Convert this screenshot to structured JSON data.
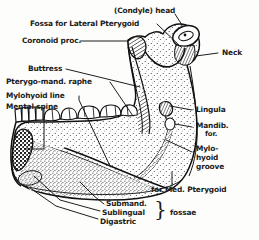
{
  "figure": {
    "background_color": "#fdfdfb",
    "ink_color": "#1a1a1a"
  },
  "labels": {
    "condyle_head": "(Condyle) head",
    "fossa_lateral_pterygoid": "Fossa for Lateral Pterygoid",
    "coronoid_proc": "Coronoid proc.",
    "neck": "Neck",
    "buttress": "Buttress",
    "pterygo_mand_raphe": "Pterygo-mand. raphe",
    "mylohyoid_line": "Mylohyoid line",
    "mental_spine": "Mental spine",
    "lingula": "Lingula",
    "mandib_line1": "Mandib.",
    "mandib_line2": "for.",
    "mylohyoid_groove_line1": "Mylo-",
    "mylohyoid_groove_line2": "hyoid",
    "mylohyoid_groove_line3": "groove",
    "for_med_pterygoid": "for Med. Pterygoid",
    "submand": "Submand.",
    "sublingual": "Sublingual",
    "digastric": "Digastric",
    "fossae": "fossae",
    "brace_glyph": "}"
  }
}
